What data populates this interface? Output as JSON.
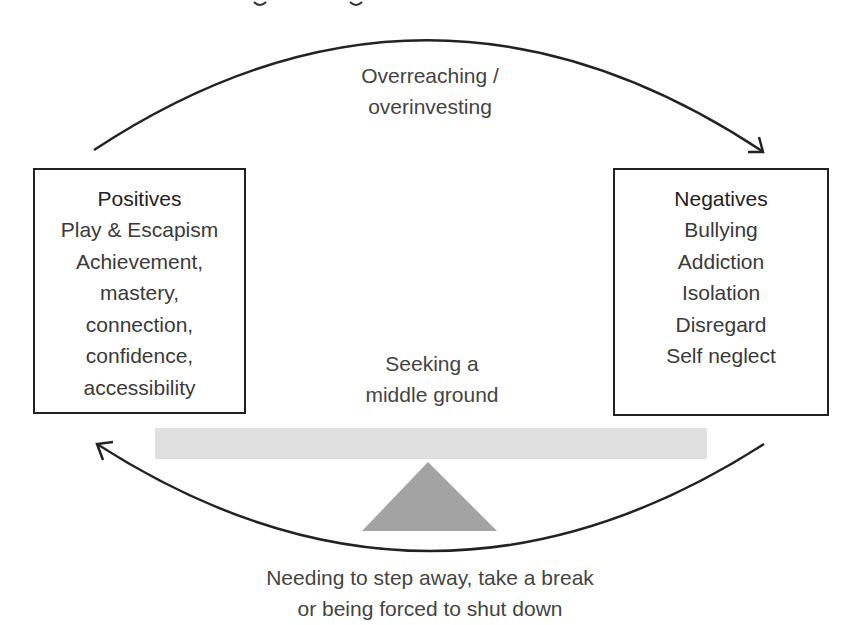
{
  "positives": {
    "title": "Positives",
    "items": [
      "Play & Escapism",
      "Achievement,",
      "mastery,",
      "connection,",
      "confidence,",
      "accessibility"
    ]
  },
  "negatives": {
    "title": "Negatives",
    "items": [
      "Bullying",
      "Addiction",
      "Isolation",
      "Disregard",
      "Self neglect"
    ]
  },
  "top_arrow": {
    "line1": "Overreaching /",
    "line2": "overinvesting"
  },
  "balance": {
    "line1": "Seeking a",
    "line2": "middle ground"
  },
  "bottom_arrow": {
    "line1": "Needing to step away, take a break",
    "line2": "or being forced to shut down"
  },
  "colors": {
    "beam": "#e0e0e0",
    "fulcrum": "#a3a3a3",
    "stroke": "#222222"
  }
}
